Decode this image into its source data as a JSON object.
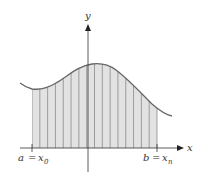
{
  "diagram": {
    "axes": {
      "x_label": "x",
      "y_label": "y"
    },
    "interval": {
      "left_label": {
        "var": "a",
        "eq": "=",
        "sym": "x",
        "sub": "0"
      },
      "right_label": {
        "var": "b",
        "eq": "=",
        "sym": "x",
        "sub": "n"
      }
    },
    "strips": {
      "count": 16,
      "x_start": 32,
      "x_end": 157
    },
    "colors": {
      "fill": "#e2e2e2",
      "strip_line": "#8a8a8a",
      "curve": "#666666",
      "axis": "#333333"
    }
  }
}
